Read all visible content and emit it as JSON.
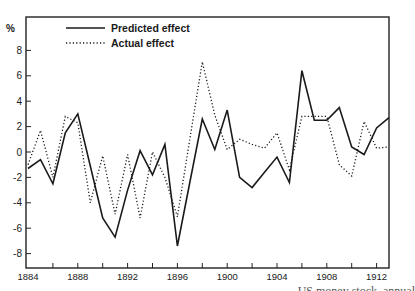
{
  "chart_data": {
    "type": "line",
    "title": "",
    "xlabel": "",
    "ylabel": "%",
    "xlim": [
      1884,
      1913
    ],
    "ylim": [
      -9.2,
      10.7
    ],
    "grid": false,
    "legend_position": "top-left (inside)",
    "x_ticks_labeled": [
      1884,
      1888,
      1892,
      1896,
      1900,
      1904,
      1908,
      1912
    ],
    "x_minor_ticks_every": 2,
    "y_ticks": [
      -8,
      -6,
      -4,
      -2,
      0,
      2,
      4,
      6,
      8
    ],
    "x": [
      1884,
      1885,
      1886,
      1887,
      1888,
      1889,
      1890,
      1891,
      1892,
      1893,
      1894,
      1895,
      1896,
      1897,
      1898,
      1899,
      1900,
      1901,
      1902,
      1903,
      1904,
      1905,
      1906,
      1907,
      1908,
      1909,
      1910,
      1911,
      1912,
      1913
    ],
    "series": [
      {
        "name": "Predicted effect",
        "style": "solid",
        "values": [
          -1.3,
          -0.6,
          -2.5,
          1.5,
          3.0,
          -1.1,
          -5.2,
          -6.7,
          -3.0,
          0.1,
          -1.8,
          0.6,
          -7.4,
          -2.4,
          2.6,
          0.2,
          3.3,
          -2.0,
          -2.8,
          -1.6,
          -0.4,
          -2.4,
          6.4,
          2.5,
          2.5,
          3.5,
          0.4,
          -0.2,
          1.9,
          2.7
        ]
      },
      {
        "name": "Actual effect",
        "style": "dotted",
        "values": [
          -1.0,
          1.7,
          -2.0,
          2.8,
          2.3,
          -4.0,
          -0.3,
          -4.9,
          -0.2,
          -5.2,
          0.0,
          -2.0,
          -5.1,
          1.0,
          7.1,
          2.9,
          0.2,
          1.0,
          0.6,
          0.3,
          1.5,
          -1.4,
          2.8,
          2.8,
          2.8,
          -1.0,
          -1.9,
          2.4,
          0.3,
          0.4
        ]
      }
    ]
  },
  "axes": {
    "y_unit_label": "%",
    "x_tick_labels": [
      "1884",
      "1888",
      "1892",
      "1896",
      "1900",
      "1904",
      "1908",
      "1912"
    ],
    "y_tick_labels": [
      "8",
      "6",
      "4",
      "2",
      "0",
      "-2",
      "-4",
      "-6",
      "-8"
    ]
  },
  "legend": {
    "items": [
      {
        "label": "Predicted effect",
        "style": "solid"
      },
      {
        "label": "Actual effect",
        "style": "dotted"
      }
    ]
  },
  "caption": {
    "text": "US money stock, annual"
  },
  "colors": {
    "line": "#1a1a1a",
    "axis": "#222222",
    "background": "#ffffff"
  }
}
